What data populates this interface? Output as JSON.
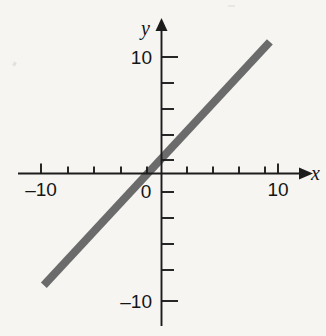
{
  "figure": {
    "background_color": "#f6f5f2",
    "axis_color": "#1c1c1c",
    "line_color": "#6b6b6b"
  },
  "axes": {
    "x_axis_label": "x",
    "y_axis_label": "y",
    "x_tick_labels": [
      "–10",
      "10"
    ],
    "y_tick_labels": [
      "10",
      "–10"
    ],
    "origin_label": "0"
  },
  "chart_data": {
    "type": "line",
    "title": "",
    "subtitle": "",
    "xlabel": "x",
    "ylabel": "y",
    "xlim": [
      -12,
      11.5
    ],
    "ylim": [
      -12.5,
      11.8
    ],
    "x_ticks": [
      -10,
      -8,
      -6,
      -4,
      -2,
      0,
      2,
      4,
      6,
      8,
      10
    ],
    "y_ticks": [
      -10,
      -8,
      -6,
      -4,
      -2,
      0,
      2,
      4,
      6,
      8,
      10
    ],
    "x_tick_labels_shown": {
      "-10": "–10",
      "0": "0",
      "10": "10"
    },
    "y_tick_labels_shown": {
      "10": "10",
      "-10": "–10"
    },
    "grid": false,
    "legend": false,
    "series": [
      {
        "name": "line",
        "slope": 1.08,
        "intercept": 1.3,
        "x": [
          -10.1,
          9.3
        ],
        "y": [
          -9.6,
          11.3
        ],
        "color": "#6b6b6b",
        "width_px": 8
      }
    ],
    "annotations": []
  }
}
